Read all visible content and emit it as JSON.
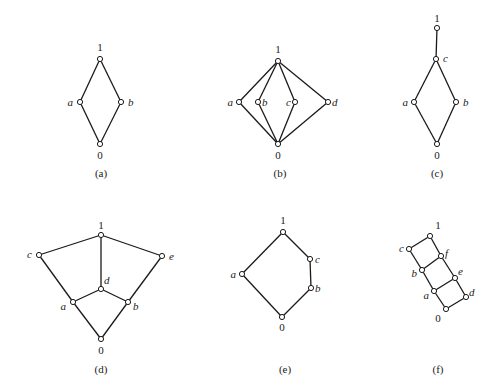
{
  "diagrams": [
    {
      "id": "a",
      "caption": "(a)",
      "caption_pos": [
        101,
        177
      ],
      "nodes": [
        {
          "name": "1",
          "x": 100,
          "y": 59,
          "lx": 100,
          "ly": 51,
          "anchor": "middle",
          "italic": false
        },
        {
          "name": "a",
          "x": 80,
          "y": 102,
          "lx": 73,
          "ly": 106,
          "anchor": "end",
          "italic": true
        },
        {
          "name": "b",
          "x": 121,
          "y": 102,
          "lx": 128,
          "ly": 106,
          "anchor": "start",
          "italic": true
        },
        {
          "name": "0",
          "x": 100,
          "y": 144,
          "lx": 100,
          "ly": 159,
          "anchor": "middle",
          "italic": false
        }
      ],
      "edges": [
        [
          "1",
          "a"
        ],
        [
          "1",
          "b"
        ],
        [
          "a",
          "0"
        ],
        [
          "b",
          "0"
        ]
      ]
    },
    {
      "id": "b",
      "caption": "(b)",
      "caption_pos": [
        280,
        177
      ],
      "nodes": [
        {
          "name": "1",
          "x": 278,
          "y": 61,
          "lx": 278,
          "ly": 53,
          "anchor": "middle",
          "italic": false
        },
        {
          "name": "a",
          "x": 239,
          "y": 102,
          "lx": 233,
          "ly": 106,
          "anchor": "end",
          "italic": true
        },
        {
          "name": "b",
          "x": 258,
          "y": 102,
          "lx": 262,
          "ly": 106,
          "anchor": "start",
          "italic": true
        },
        {
          "name": "c",
          "x": 295,
          "y": 102,
          "lx": 291,
          "ly": 106,
          "anchor": "end",
          "italic": true
        },
        {
          "name": "d",
          "x": 328,
          "y": 102,
          "lx": 332,
          "ly": 106,
          "anchor": "start",
          "italic": true
        },
        {
          "name": "0",
          "x": 278,
          "y": 144,
          "lx": 278,
          "ly": 159,
          "anchor": "middle",
          "italic": false
        }
      ],
      "edges": [
        [
          "1",
          "a"
        ],
        [
          "1",
          "b"
        ],
        [
          "1",
          "c"
        ],
        [
          "1",
          "d"
        ],
        [
          "a",
          "0"
        ],
        [
          "b",
          "0"
        ],
        [
          "c",
          "0"
        ],
        [
          "d",
          "0"
        ]
      ]
    },
    {
      "id": "c",
      "caption": "(c)",
      "caption_pos": [
        437,
        177
      ],
      "nodes": [
        {
          "name": "1",
          "x": 437,
          "y": 28,
          "lx": 437,
          "ly": 22,
          "anchor": "middle",
          "italic": false
        },
        {
          "name": "c",
          "x": 436,
          "y": 59,
          "lx": 443,
          "ly": 62,
          "anchor": "start",
          "italic": true
        },
        {
          "name": "a",
          "x": 414,
          "y": 102,
          "lx": 408,
          "ly": 106,
          "anchor": "end",
          "italic": true
        },
        {
          "name": "b",
          "x": 456,
          "y": 102,
          "lx": 463,
          "ly": 106,
          "anchor": "start",
          "italic": true
        },
        {
          "name": "0",
          "x": 437,
          "y": 144,
          "lx": 437,
          "ly": 159,
          "anchor": "middle",
          "italic": false
        }
      ],
      "edges": [
        [
          "1",
          "c"
        ],
        [
          "c",
          "a"
        ],
        [
          "c",
          "b"
        ],
        [
          "a",
          "0"
        ],
        [
          "b",
          "0"
        ]
      ]
    },
    {
      "id": "d",
      "caption": "(d)",
      "caption_pos": [
        101,
        373
      ],
      "nodes": [
        {
          "name": "1",
          "x": 101,
          "y": 235,
          "lx": 101,
          "ly": 229,
          "anchor": "middle",
          "italic": false
        },
        {
          "name": "c",
          "x": 39,
          "y": 255,
          "lx": 32,
          "ly": 258,
          "anchor": "end",
          "italic": true
        },
        {
          "name": "e",
          "x": 162,
          "y": 256,
          "lx": 169,
          "ly": 260,
          "anchor": "start",
          "italic": true
        },
        {
          "name": "d",
          "x": 101,
          "y": 289,
          "lx": 104,
          "ly": 284,
          "anchor": "start",
          "italic": true
        },
        {
          "name": "a",
          "x": 73,
          "y": 302,
          "lx": 66,
          "ly": 310,
          "anchor": "end",
          "italic": true
        },
        {
          "name": "b",
          "x": 128,
          "y": 302,
          "lx": 133,
          "ly": 310,
          "anchor": "start",
          "italic": true
        },
        {
          "name": "0",
          "x": 101,
          "y": 339,
          "lx": 101,
          "ly": 354,
          "anchor": "middle",
          "italic": false
        }
      ],
      "edges": [
        [
          "1",
          "c"
        ],
        [
          "1",
          "e"
        ],
        [
          "1",
          "d"
        ],
        [
          "c",
          "a"
        ],
        [
          "e",
          "b"
        ],
        [
          "d",
          "a"
        ],
        [
          "d",
          "b"
        ],
        [
          "a",
          "0"
        ],
        [
          "b",
          "0"
        ]
      ]
    },
    {
      "id": "e",
      "caption": "(e)",
      "caption_pos": [
        285,
        373
      ],
      "nodes": [
        {
          "name": "1",
          "x": 283,
          "y": 232,
          "lx": 283,
          "ly": 224,
          "anchor": "middle",
          "italic": false
        },
        {
          "name": "c",
          "x": 310,
          "y": 259,
          "lx": 315,
          "ly": 263,
          "anchor": "start",
          "italic": true
        },
        {
          "name": "a",
          "x": 242,
          "y": 274,
          "lx": 236,
          "ly": 278,
          "anchor": "end",
          "italic": true
        },
        {
          "name": "b",
          "x": 311,
          "y": 288,
          "lx": 315,
          "ly": 292,
          "anchor": "start",
          "italic": true
        },
        {
          "name": "0",
          "x": 282,
          "y": 317,
          "lx": 282,
          "ly": 331,
          "anchor": "middle",
          "italic": false
        }
      ],
      "edges": [
        [
          "1",
          "c"
        ],
        [
          "c",
          "b"
        ],
        [
          "1",
          "a"
        ],
        [
          "a",
          "0"
        ],
        [
          "b",
          "0"
        ]
      ]
    },
    {
      "id": "f",
      "caption": "(f)",
      "caption_pos": [
        438,
        373
      ],
      "nodes": [
        {
          "name": "1",
          "x": 430,
          "y": 236,
          "lx": 438,
          "ly": 229,
          "anchor": "middle",
          "italic": false
        },
        {
          "name": "c",
          "x": 409,
          "y": 249,
          "lx": 404,
          "ly": 252,
          "anchor": "end",
          "italic": true
        },
        {
          "name": "f",
          "x": 441,
          "y": 256,
          "lx": 445,
          "ly": 257,
          "anchor": "start",
          "italic": true
        },
        {
          "name": "b",
          "x": 422,
          "y": 270,
          "lx": 417,
          "ly": 277,
          "anchor": "end",
          "italic": true
        },
        {
          "name": "e",
          "x": 455,
          "y": 278,
          "lx": 458,
          "ly": 275,
          "anchor": "start",
          "italic": true
        },
        {
          "name": "a",
          "x": 434,
          "y": 291,
          "lx": 429,
          "ly": 299,
          "anchor": "end",
          "italic": true
        },
        {
          "name": "d",
          "x": 466,
          "y": 297,
          "lx": 469,
          "ly": 296,
          "anchor": "start",
          "italic": true
        },
        {
          "name": "0",
          "x": 446,
          "y": 309,
          "lx": 438,
          "ly": 322,
          "anchor": "middle",
          "italic": false
        }
      ],
      "edges": [
        [
          "1",
          "c"
        ],
        [
          "1",
          "f"
        ],
        [
          "c",
          "b"
        ],
        [
          "f",
          "b"
        ],
        [
          "f",
          "e"
        ],
        [
          "b",
          "a"
        ],
        [
          "e",
          "a"
        ],
        [
          "e",
          "d"
        ],
        [
          "a",
          "0"
        ],
        [
          "d",
          "0"
        ]
      ]
    }
  ]
}
